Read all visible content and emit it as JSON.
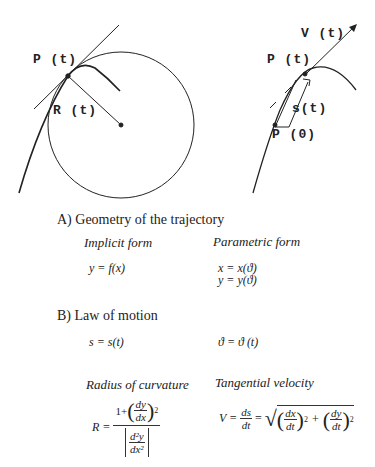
{
  "figures": {
    "left": {
      "point_label": "P (t)",
      "radius_label": "R (t)"
    },
    "right": {
      "velocity_label": "V (t)",
      "point_label": "P (t)",
      "arc_label": "s(t)",
      "origin_label": "P (0)"
    }
  },
  "section_a": {
    "title": "A) Geometry of the trajectory",
    "implicit": {
      "heading": "Implicit form",
      "equation": "y = f(x)"
    },
    "parametric": {
      "heading": "Parametric form",
      "eq_x": "x = x(ϑ)",
      "eq_y": "y = y(ϑ)"
    }
  },
  "section_b": {
    "title": "B) Law of motion",
    "eq_s": "s = s(t)",
    "eq_theta": "ϑ = ϑ (t)",
    "radius": {
      "heading": "Radius of curvature",
      "lhs": "R =",
      "num_one": "1+",
      "dy": "dy",
      "dx": "dx",
      "exp": "2",
      "d2y": "d²y",
      "dx2": "dx²"
    },
    "velocity": {
      "heading": "Tangential velocity",
      "lhs": "V =",
      "ds": "ds",
      "dt": "dt",
      "eq": "=",
      "dx": "dx",
      "dy": "dy",
      "plus": "+",
      "exp": "2"
    }
  }
}
